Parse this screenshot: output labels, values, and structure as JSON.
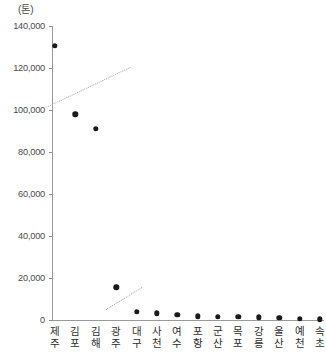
{
  "chart_data": {
    "type": "scatter",
    "title": "",
    "subtitle": "",
    "unit_label": "(톤)",
    "xlabel": "",
    "ylabel": "",
    "ylim": [
      0,
      140000
    ],
    "ytick_values": [
      0,
      20000,
      40000,
      60000,
      80000,
      100000,
      120000,
      140000
    ],
    "ytick_labels": [
      "0",
      "20,000",
      "40,000",
      "60,000",
      "80,000",
      "100,000",
      "120,000",
      "140,000"
    ],
    "grid": false,
    "legend": null,
    "categories": [
      "제주",
      "김포",
      "김해",
      "광주",
      "대구",
      "사천",
      "여수",
      "포항",
      "군산",
      "목포",
      "강릉",
      "울산",
      "예천",
      "속초"
    ],
    "values": [
      130500,
      98000,
      91000,
      15500,
      4000,
      3200,
      2600,
      1800,
      1500,
      1400,
      1200,
      1000,
      700,
      300
    ],
    "marker": {
      "shape": "circle",
      "color": "#1a1a1a",
      "size": 5.4
    },
    "annotations": [
      {
        "name": "upper-trend-line",
        "style": "dotted",
        "color": "#a8a8b5",
        "x1": 48,
        "y1": 106,
        "x2": 130,
        "y2": 67
      },
      {
        "name": "lower-trend-line",
        "style": "dotted",
        "color": "#a8a8b5",
        "x1": 106,
        "y1": 309,
        "x2": 142,
        "y2": 287
      }
    ]
  }
}
